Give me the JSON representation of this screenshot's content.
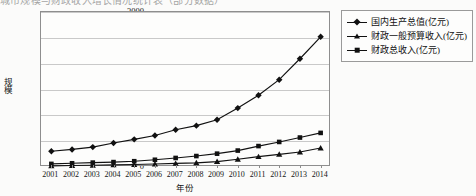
{
  "top_cutoff_text": "城市规模与财政收入增长情况统计表（部分数据）",
  "chart_data": {
    "type": "line",
    "title": "",
    "xlabel": "年份",
    "ylabel": "规模",
    "ylim": [
      0,
      3000
    ],
    "ytick_step": 500,
    "yticks": [
      0,
      500,
      1000,
      1500,
      2000,
      2500,
      3000
    ],
    "grid": true,
    "legend_position": "top-right-outside",
    "categories": [
      "2001",
      "2002",
      "2003",
      "2004",
      "2005",
      "2006",
      "2007",
      "2008",
      "2009",
      "2010",
      "2011",
      "2012",
      "2013",
      "2014"
    ],
    "series": [
      {
        "name": "国内生产总值(亿元)",
        "marker": "diamond",
        "values": [
          305,
          340,
          385,
          465,
          535,
          610,
          720,
          800,
          915,
          1140,
          1390,
          1690,
          2095,
          2520
        ]
      },
      {
        "name": "财政一般预算收入(亿元)",
        "marker": "triangle",
        "values": [
          22,
          28,
          34,
          40,
          48,
          58,
          70,
          80,
          105,
          150,
          200,
          245,
          290,
          368
        ]
      },
      {
        "name": "财政总收入(亿元)",
        "marker": "square",
        "values": [
          60,
          72,
          85,
          95,
          112,
          140,
          175,
          212,
          258,
          318,
          405,
          485,
          570,
          660
        ]
      }
    ]
  }
}
